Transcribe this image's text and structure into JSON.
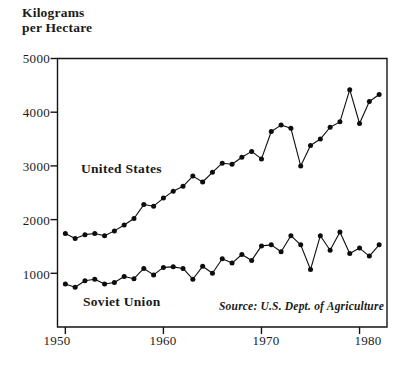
{
  "chart_data": {
    "type": "line",
    "title": "Kilograms\nper Hectare",
    "xlabel": "",
    "ylabel": "Kilograms per Hectare",
    "xlim": [
      1949.2,
      1982.8
    ],
    "ylim": [
      0,
      5000
    ],
    "xticks": [
      1950,
      1960,
      1970,
      1980
    ],
    "xtick_labels": [
      "1950",
      "1960",
      "1970",
      "1980"
    ],
    "yticks": [
      1000,
      2000,
      3000,
      4000,
      5000
    ],
    "ytick_labels": [
      "1000",
      "2000",
      "3000",
      "4000",
      "5000"
    ],
    "grid": false,
    "legend_position": "inline-annotation",
    "annotations": [
      {
        "name": "source",
        "text": "Source: U.S. Dept. of Agriculture"
      }
    ],
    "x": [
      1950,
      1951,
      1952,
      1953,
      1954,
      1955,
      1956,
      1957,
      1958,
      1959,
      1960,
      1961,
      1962,
      1963,
      1964,
      1965,
      1966,
      1967,
      1968,
      1969,
      1970,
      1971,
      1972,
      1973,
      1974,
      1975,
      1976,
      1977,
      1978,
      1979,
      1980,
      1981,
      1982
    ],
    "series": [
      {
        "name": "United States",
        "label": "United States",
        "color": "#0d0d0d",
        "marker": "filled-circle",
        "values": [
          1740,
          1650,
          1720,
          1740,
          1700,
          1790,
          1900,
          2020,
          2280,
          2250,
          2400,
          2530,
          2620,
          2810,
          2700,
          2880,
          3050,
          3030,
          3160,
          3270,
          3130,
          3640,
          3760,
          3700,
          3000,
          3380,
          3500,
          3720,
          3820,
          4420,
          3790,
          4200,
          4330
        ]
      },
      {
        "name": "Soviet Union",
        "label": "Soviet Union",
        "color": "#0d0d0d",
        "marker": "filled-circle",
        "values": [
          800,
          740,
          860,
          890,
          800,
          830,
          940,
          900,
          1090,
          970,
          1110,
          1120,
          1090,
          890,
          1130,
          1000,
          1270,
          1190,
          1350,
          1240,
          1510,
          1530,
          1400,
          1700,
          1530,
          1070,
          1700,
          1430,
          1770,
          1370,
          1470,
          1320,
          1530
        ]
      }
    ]
  },
  "labels": {
    "axis_title": "Kilograms\nper Hectare",
    "series_us": "United States",
    "series_su": "Soviet Union",
    "source": "Source: U.S. Dept. of Agriculture"
  }
}
